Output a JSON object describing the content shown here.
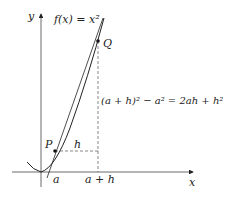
{
  "diagram": {
    "type": "secant-line-on-parabola",
    "function_label": "f(x) = x²",
    "axes": {
      "x_label": "x",
      "y_label": "y"
    },
    "points": [
      {
        "name": "P",
        "label": "P"
      },
      {
        "name": "Q",
        "label": "Q"
      }
    ],
    "tick_labels": {
      "a": "a",
      "a_plus_h": "a + h"
    },
    "horizontal_segment_label": "h",
    "vertical_segment_label": "(a + h)² − a² = 2ah + h²",
    "colors": {
      "line": "#222222",
      "dashed": "#555555",
      "background": "#ffffff"
    }
  }
}
